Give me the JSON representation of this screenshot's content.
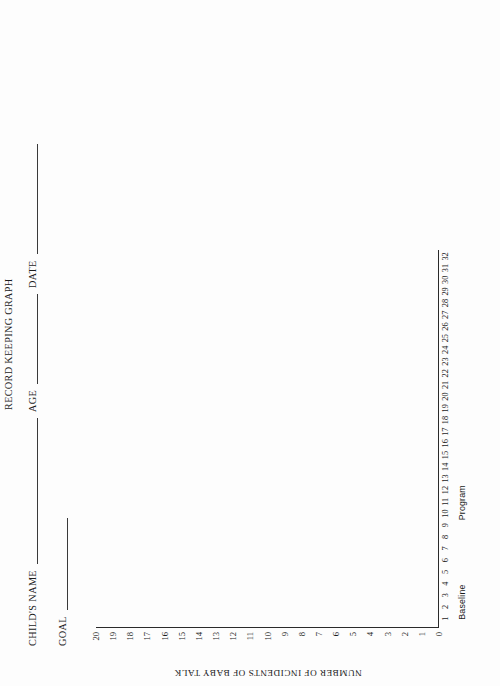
{
  "document": {
    "title": "RECORD KEEPING GRAPH"
  },
  "form_fields": [
    {
      "label": "CHILD'S NAME",
      "value": "",
      "rule": "name"
    },
    {
      "label": "AGE",
      "value": "",
      "rule": "age"
    },
    {
      "label": "DATE",
      "value": "",
      "rule": "date"
    },
    {
      "label": "GOAL",
      "value": "",
      "rule": "goal"
    }
  ],
  "chart_data": {
    "type": "line",
    "title": "RECORD KEEPING GRAPH",
    "xlabel": "",
    "ylabel": "NUMBER OF INCIDENTS OF BABY TALK",
    "xlim": [
      0,
      32
    ],
    "ylim": [
      0,
      20
    ],
    "grid": false,
    "legend": "none",
    "x_tick_labels": [
      "1",
      "2",
      "3",
      "4",
      "5",
      "6",
      "7",
      "8",
      "9",
      "10",
      "11",
      "12",
      "13",
      "14",
      "15",
      "16",
      "17",
      "18",
      "19",
      "20",
      "21",
      "22",
      "23",
      "24",
      "25",
      "26",
      "27",
      "28",
      "29",
      "30",
      "31",
      "32"
    ],
    "y_tick_labels": [
      "0",
      "1",
      "2",
      "3",
      "4",
      "5",
      "6",
      "7",
      "8",
      "9",
      "10",
      "11",
      "12",
      "13",
      "14",
      "15",
      "16",
      "17",
      "18",
      "19",
      "20"
    ],
    "series": [
      {
        "name": "incidents",
        "x": [],
        "values": []
      }
    ],
    "annotations": [
      {
        "text": "Baseline",
        "x": 2.5
      },
      {
        "text": "Program",
        "x": 11
      }
    ]
  }
}
